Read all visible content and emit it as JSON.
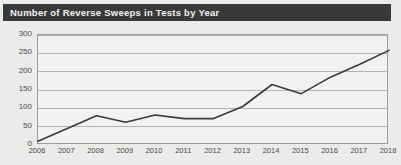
{
  "title": {
    "text": "Number of Reverse Sweeps in Tests by Year"
  },
  "chart_data": {
    "type": "line",
    "title": "Number of Reverse Sweeps in Tests by Year",
    "xlabel": "",
    "ylabel": "",
    "categories": [
      "2006",
      "2007",
      "2008",
      "2009",
      "2010",
      "2011",
      "2012",
      "2013",
      "2014",
      "2015",
      "2016",
      "2017",
      "2018"
    ],
    "values": [
      10,
      45,
      80,
      62,
      82,
      72,
      72,
      105,
      165,
      140,
      185,
      220,
      258
    ],
    "ylim": [
      0,
      300
    ],
    "yticks": [
      0,
      50,
      100,
      150,
      200,
      250,
      300
    ],
    "ytick_labels": [
      "0",
      "50",
      "100",
      "150",
      "200",
      "250",
      "300"
    ],
    "grid": true,
    "legend": false,
    "line_color": "#3b3b3b",
    "grid_color": "#b4b4b4",
    "plot_background": "#f3f3f2",
    "title_background": "#3a3a3a",
    "title_color": "#f2f2f2"
  }
}
